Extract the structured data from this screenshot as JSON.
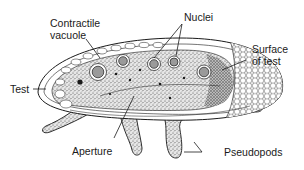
{
  "diagram": {
    "labels": {
      "contractile_vacuole_line1": "Contractile",
      "contractile_vacuole_line2": "vacuole",
      "nuclei": "Nuclei",
      "surface_of_test_line1": "Surface",
      "surface_of_test_line2": "of test",
      "test": "Test",
      "aperture": "Aperture",
      "pseudopods": "Pseudopods"
    },
    "colors": {
      "ink": "#1a1a1a",
      "stipple_fill": "#d9d9d9",
      "nucleus_fill": "#9a9a9a",
      "background": "#ffffff"
    }
  }
}
